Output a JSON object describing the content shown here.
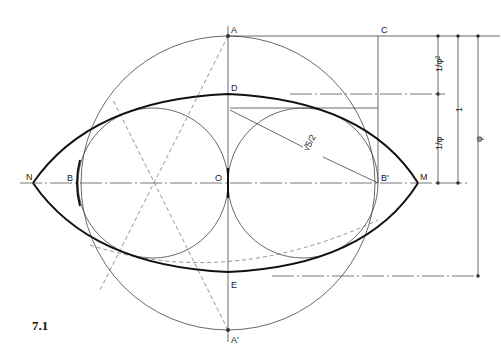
{
  "figure": {
    "number": "7.1",
    "points": {
      "A": "A",
      "A_prime": "A'",
      "C": "C",
      "D": "D",
      "E": "E",
      "O": "O",
      "B": "B",
      "B_prime": "B'",
      "N": "N",
      "M": "M"
    },
    "radius_label": "√5/2",
    "dimensions": {
      "top_segment": "1/φ²",
      "lower_segment": "1/φ",
      "middle_column": "1",
      "outer_column": "φ"
    }
  }
}
